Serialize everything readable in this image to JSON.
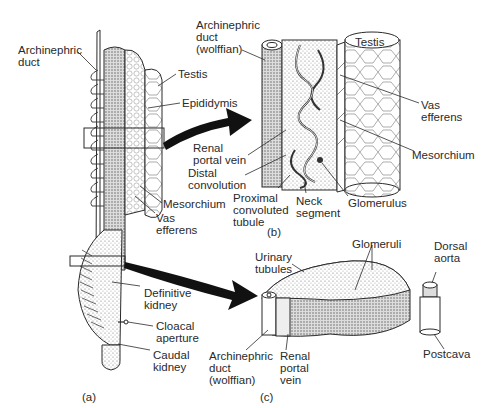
{
  "figure": {
    "panels": {
      "a": {
        "caption": "(a)",
        "labels": {
          "archinephric_duct": "Archinephric\nduct",
          "testis": "Testis",
          "epididymis": "Epididymis",
          "mesorchium": "Mesorchium",
          "vas_efferens": "Vas\nefferens",
          "definitive_kidney": "Definitive\nkidney",
          "cloacal_aperture": "Cloacal\naperture",
          "caudal_kidney": "Caudal\nkidney"
        }
      },
      "b": {
        "caption": "(b)",
        "labels": {
          "archinephric_duct_wolffian": "Archinephric\nduct\n(wolffian)",
          "testis": "Testis",
          "vas_efferens": "Vas\nefferens",
          "mesorchium": "Mesorchium",
          "renal_portal_vein": "Renal\nportal vein",
          "distal_convolution": "Distal\nconvolution",
          "proximal_convoluted_tubule": "Proximal\nconvoluted\ntubule",
          "neck_segment": "Neck\nsegment",
          "glomerulus": "Glomerulus"
        }
      },
      "c": {
        "caption": "(c)",
        "labels": {
          "urinary_tubules": "Urinary\ntubules",
          "glomeruli": "Glomeruli",
          "dorsal_aorta": "Dorsal\naorta",
          "archinephric_duct_wolffian": "Archinephric\nduct\n(wolffian)",
          "renal_portal_vein": "Renal\nportal\nvein",
          "postcava": "Postcava"
        }
      }
    },
    "colors": {
      "ink": "#2a2a2a",
      "stipple": "#9a9a9a",
      "arrow": "#111111",
      "background": "#ffffff"
    }
  }
}
